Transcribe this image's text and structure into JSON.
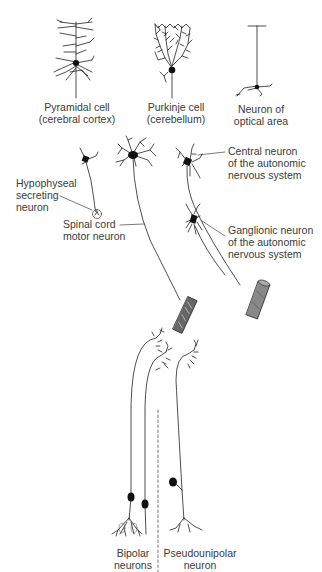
{
  "diagram": {
    "labels": {
      "pyramidal": [
        "Pyramidal cell",
        "(cerebral cortex)"
      ],
      "purkinje": [
        "Purkinje cell",
        "(cerebellum)"
      ],
      "optical": [
        "Neuron of",
        "optical area"
      ],
      "central_autonomic": [
        "Central neuron",
        "of the autonomic",
        "nervous system"
      ],
      "hypophyseal": [
        "Hypophyseal",
        "secreting",
        "neuron"
      ],
      "spinal_motor": [
        "Spinal cord",
        "motor neuron"
      ],
      "ganglionic": [
        "Ganglionic neuron",
        "of the autonomic",
        "nervous system"
      ],
      "bipolar": [
        "Bipolar",
        "neurons"
      ],
      "pseudounipolar": [
        "Pseudounipolar",
        "neuron"
      ]
    },
    "colors": {
      "line": "#222222",
      "text": "#3a3a3a",
      "background": "#ffffff"
    }
  }
}
